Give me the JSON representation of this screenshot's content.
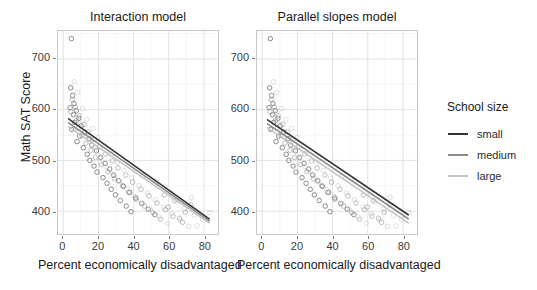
{
  "chart_data": {
    "type": "scatter",
    "title": "",
    "panels": [
      {
        "title": "Interaction model",
        "xlabel": "Percent economically disadvantaged",
        "ylabel": "Math SAT Score"
      },
      {
        "title": "Parallel slopes model",
        "xlabel": "Percent economically disadvantaged",
        "ylabel": "Math SAT Score"
      }
    ],
    "xlabel": "Percent economically disadvantaged",
    "ylabel": "Math SAT Score",
    "xlim": [
      -3,
      88
    ],
    "ylim": [
      355,
      755
    ],
    "xticks": [
      0,
      20,
      40,
      60,
      80
    ],
    "yticks": [
      400,
      500,
      600,
      700
    ],
    "x_minor_ticks": [
      10,
      30,
      50,
      70
    ],
    "y_minor_ticks": [
      450,
      550,
      650,
      750
    ],
    "grid": true,
    "legend": {
      "title": "School size",
      "position": "right",
      "entries": [
        {
          "label": "small",
          "color": "#333333"
        },
        {
          "label": "medium",
          "color": "#8c8c8c"
        },
        {
          "label": "large",
          "color": "#c4c4c4"
        }
      ]
    },
    "series": [
      {
        "name": "small",
        "color": "#333333",
        "interaction_fit": {
          "x0": 3,
          "y0": 582,
          "x1": 83,
          "y1": 385
        },
        "parallel_fit": {
          "x0": 3,
          "y0": 580,
          "x1": 83,
          "y1": 393
        },
        "points": [
          [
            4.6,
            740
          ],
          [
            4.2,
            643
          ],
          [
            5.3,
            628
          ],
          [
            6.1,
            612
          ],
          [
            3.9,
            604
          ],
          [
            7.4,
            598
          ],
          [
            5.8,
            590
          ],
          [
            8.9,
            583
          ],
          [
            6.5,
            575
          ],
          [
            10.2,
            568
          ],
          [
            4.8,
            561
          ],
          [
            12.1,
            556
          ],
          [
            9.3,
            548
          ],
          [
            14.7,
            543
          ],
          [
            7.8,
            537
          ],
          [
            16.2,
            530
          ],
          [
            11.4,
            525
          ],
          [
            18.9,
            519
          ],
          [
            13.6,
            512
          ],
          [
            21.3,
            506
          ],
          [
            15.1,
            500
          ],
          [
            23.8,
            494
          ],
          [
            17.5,
            489
          ],
          [
            26.4,
            483
          ],
          [
            19.2,
            477
          ],
          [
            28.7,
            471
          ],
          [
            22.6,
            466
          ],
          [
            31.5,
            460
          ],
          [
            24.9,
            455
          ],
          [
            34.2,
            449
          ],
          [
            27.3,
            443
          ],
          [
            37.8,
            437
          ],
          [
            29.6,
            432
          ],
          [
            41.2,
            426
          ],
          [
            32.4,
            421
          ],
          [
            44.6,
            415
          ],
          [
            35.8,
            410
          ],
          [
            48.3,
            404
          ],
          [
            38.5,
            399
          ],
          [
            52.1,
            393
          ]
        ]
      },
      {
        "name": "medium",
        "color": "#8c8c8c",
        "interaction_fit": {
          "x0": 3,
          "y0": 574,
          "x1": 83,
          "y1": 381
        },
        "parallel_fit": {
          "x0": 3,
          "y0": 572,
          "x1": 83,
          "y1": 385
        },
        "points": [
          [
            5.1,
            620
          ],
          [
            6.8,
            605
          ],
          [
            4.3,
            596
          ],
          [
            9.1,
            588
          ],
          [
            7.6,
            579
          ],
          [
            11.8,
            571
          ],
          [
            8.4,
            563
          ],
          [
            14.2,
            556
          ],
          [
            10.7,
            549
          ],
          [
            17.6,
            541
          ],
          [
            12.9,
            534
          ],
          [
            20.4,
            527
          ],
          [
            15.8,
            520
          ],
          [
            24.1,
            513
          ],
          [
            18.3,
            506
          ],
          [
            27.9,
            499
          ],
          [
            21.7,
            492
          ],
          [
            31.2,
            485
          ],
          [
            25.4,
            478
          ],
          [
            35.6,
            471
          ],
          [
            29.1,
            464
          ],
          [
            39.4,
            457
          ],
          [
            33.8,
            450
          ],
          [
            44.2,
            443
          ],
          [
            37.1,
            437
          ],
          [
            48.7,
            430
          ],
          [
            41.5,
            423
          ],
          [
            53.3,
            416
          ],
          [
            46.2,
            410
          ],
          [
            58.1,
            403
          ],
          [
            50.9,
            397
          ],
          [
            62.4,
            390
          ],
          [
            55.3,
            384
          ],
          [
            67.8,
            378
          ],
          [
            59.7,
            408
          ],
          [
            63.2,
            421
          ],
          [
            69.4,
            398
          ],
          [
            72.6,
            412
          ],
          [
            57.5,
            432
          ],
          [
            66.1,
            386
          ]
        ]
      },
      {
        "name": "large",
        "color": "#c4c4c4",
        "interaction_fit": {
          "x0": 3,
          "y0": 566,
          "x1": 83,
          "y1": 377
        },
        "parallel_fit": {
          "x0": 3,
          "y0": 564,
          "x1": 83,
          "y1": 377
        },
        "points": [
          [
            6.3,
            655
          ],
          [
            8.2,
            634
          ],
          [
            5.4,
            618
          ],
          [
            10.9,
            602
          ],
          [
            7.1,
            592
          ],
          [
            13.4,
            581
          ],
          [
            9.8,
            572
          ],
          [
            16.7,
            563
          ],
          [
            12.2,
            554
          ],
          [
            19.8,
            545
          ],
          [
            14.9,
            537
          ],
          [
            23.4,
            528
          ],
          [
            17.9,
            520
          ],
          [
            27.2,
            512
          ],
          [
            20.9,
            504
          ],
          [
            30.8,
            496
          ],
          [
            24.3,
            488
          ],
          [
            34.7,
            480
          ],
          [
            28.2,
            473
          ],
          [
            38.9,
            465
          ],
          [
            32.1,
            458
          ],
          [
            43.1,
            450
          ],
          [
            36.4,
            443
          ],
          [
            47.8,
            436
          ],
          [
            40.7,
            429
          ],
          [
            52.4,
            422
          ],
          [
            45.3,
            415
          ],
          [
            57.2,
            408
          ],
          [
            49.8,
            402
          ],
          [
            61.9,
            395
          ],
          [
            54.6,
            389
          ],
          [
            66.7,
            382
          ],
          [
            59.2,
            376
          ],
          [
            71.3,
            370
          ],
          [
            64.1,
            418
          ],
          [
            68.9,
            405
          ],
          [
            74.6,
            392
          ],
          [
            79.2,
            384
          ],
          [
            83.4,
            397
          ],
          [
            76.1,
            371
          ],
          [
            61.4,
            436
          ],
          [
            57.8,
            448
          ],
          [
            52.9,
            459
          ],
          [
            72.8,
            427
          ],
          [
            45.6,
            470
          ]
        ]
      }
    ]
  }
}
